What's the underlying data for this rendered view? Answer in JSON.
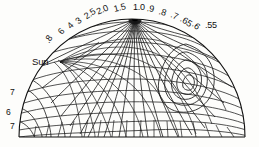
{
  "figure": {
    "type": "sky-dome-luminance-diagram",
    "background_color": "#fdfdfb",
    "line_color": "#111111",
    "sun_label": "Sun"
  },
  "chart_data": {
    "type": "line",
    "title": "",
    "subtitle": "",
    "xlabel": "",
    "ylabel": "",
    "grid": true,
    "legend_position": "none",
    "geometry": {
      "dome_center_x": 132,
      "dome_baseline_y": 137,
      "dome_radius_x": 113,
      "dome_radius_y": 118,
      "zenith_x": 135,
      "zenith_y": 19,
      "sun_x": 60,
      "sun_y": 62
    },
    "arc_contour_labels": [
      {
        "text": ".8",
        "x": 47,
        "y": 38,
        "rotate": -58
      },
      {
        "text": "6",
        "x": 60,
        "y": 29,
        "rotate": -52
      },
      {
        "text": "4",
        "x": 69,
        "y": 23,
        "rotate": -46
      },
      {
        "text": "3",
        "x": 77,
        "y": 18,
        "rotate": -40
      },
      {
        "text": "2.5",
        "x": 85,
        "y": 13,
        "rotate": -34
      },
      {
        "text": "2.0",
        "x": 97,
        "y": 8,
        "rotate": -24
      },
      {
        "text": "1.5",
        "x": 114,
        "y": 5,
        "rotate": -14
      },
      {
        "text": "1.0",
        "x": 133,
        "y": 3,
        "rotate": 0
      },
      {
        "text": ".9",
        "x": 147,
        "y": 4,
        "rotate": 10
      },
      {
        "text": ".8",
        "x": 159,
        "y": 7,
        "rotate": 18
      },
      {
        "text": ".7",
        "x": 171,
        "y": 10,
        "rotate": 26
      },
      {
        "text": ".65",
        "x": 181,
        "y": 14,
        "rotate": 34
      },
      {
        "text": ".6",
        "x": 193,
        "y": 19,
        "rotate": 40
      },
      {
        "text": ".55",
        "x": 205,
        "y": 21,
        "rotate": 0
      }
    ],
    "margin_contour_labels": [
      {
        "text": "7",
        "x": 10,
        "y": 88
      },
      {
        "text": "6",
        "x": 6,
        "y": 108
      },
      {
        "text": "7",
        "x": 10,
        "y": 122
      }
    ],
    "contour_values": [
      0.55,
      0.6,
      0.65,
      0.7,
      0.8,
      0.9,
      1.0,
      1.5,
      2.0,
      2.5,
      3,
      4,
      6,
      7,
      8
    ]
  }
}
